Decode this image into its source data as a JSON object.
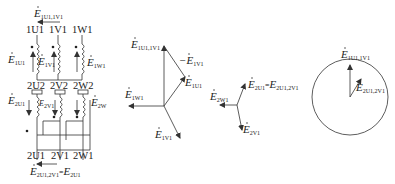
{
  "colors": {
    "line": "#333333",
    "background": "#ffffff"
  },
  "circuit": {
    "top_emf": {
      "sym": "E",
      "sub": "1U1,1V1"
    },
    "primary_terminals": [
      "1U1",
      "1V1",
      "1W1"
    ],
    "primary_emfs": [
      {
        "sym": "E",
        "sub": "1U1"
      },
      {
        "sym": "E",
        "sub": "1V1"
      },
      {
        "sym": "E",
        "sub": "1W1"
      }
    ],
    "secondary_top_terminals": [
      "2U2",
      "2V2",
      "2W2"
    ],
    "secondary_emfs": [
      {
        "sym": "E",
        "sub": "2U1"
      },
      {
        "sym": "E",
        "sub": "2V1"
      },
      {
        "sym": "E",
        "sub": "2W"
      }
    ],
    "secondary_bottom_terminals": [
      "2U1",
      "2V1",
      "2W1"
    ],
    "bottom_emf": {
      "sym": "E",
      "sub": "2U1,2V1",
      "eq": "=",
      "sym2": "E",
      "sub2": "2U1"
    }
  },
  "phasor_primary": {
    "labels": [
      {
        "sym": "E",
        "sub": "1U1,1V1"
      },
      {
        "sym": "−E",
        "sub": "1V1"
      },
      {
        "sym": "E",
        "sub": "1U1"
      },
      {
        "sym": "E",
        "sub": "1W1"
      },
      {
        "sym": "E",
        "sub": "1V1"
      }
    ]
  },
  "phasor_secondary": {
    "labels": [
      {
        "sym": "E",
        "sub": "2U1",
        "eq": "=",
        "sym2": "E",
        "sub2": "2U1,2V1"
      },
      {
        "sym": "E",
        "sub": "2W1"
      },
      {
        "sym": "E",
        "sub": "2V1"
      }
    ]
  },
  "clock_diagram": {
    "labels": [
      {
        "sym": "E",
        "sub": "1U1,1V1"
      },
      {
        "sym": "E",
        "sub": "2U1,2V1"
      }
    ]
  }
}
